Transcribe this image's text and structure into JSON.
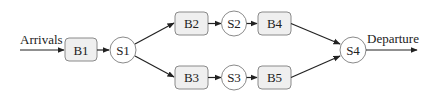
{
  "diagram": {
    "title": "",
    "labels": {
      "arrivals": "Arrivals",
      "departure": "Departure"
    },
    "buffers": [
      {
        "id": "B1",
        "label": "B1"
      },
      {
        "id": "B2",
        "label": "B2"
      },
      {
        "id": "B3",
        "label": "B3"
      },
      {
        "id": "B4",
        "label": "B4"
      },
      {
        "id": "B5",
        "label": "B5"
      }
    ],
    "servers": [
      {
        "id": "S1",
        "label": "S1"
      },
      {
        "id": "S2",
        "label": "S2"
      },
      {
        "id": "S3",
        "label": "S3"
      },
      {
        "id": "S4",
        "label": "S4"
      }
    ],
    "edges": [
      {
        "from": "Arrivals",
        "to": "B1"
      },
      {
        "from": "B1",
        "to": "S1"
      },
      {
        "from": "S1",
        "to": "B2"
      },
      {
        "from": "S1",
        "to": "B3"
      },
      {
        "from": "B2",
        "to": "S2"
      },
      {
        "from": "S2",
        "to": "B4"
      },
      {
        "from": "B3",
        "to": "S3"
      },
      {
        "from": "S3",
        "to": "B5"
      },
      {
        "from": "B4",
        "to": "S4"
      },
      {
        "from": "B5",
        "to": "S4"
      },
      {
        "from": "S4",
        "to": "Departure"
      }
    ],
    "colors": {
      "buffer_fill": "#efefef",
      "node_stroke": "#8a8a8a",
      "server_fill": "#ffffff",
      "edge": "#222222"
    }
  }
}
